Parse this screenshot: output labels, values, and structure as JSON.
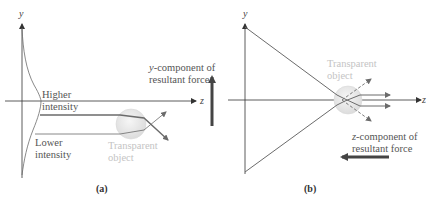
{
  "panel_a": {
    "caption": "(a)",
    "y_axis_label": "y",
    "z_axis_label": "z",
    "higher_intensity_line1": "Higher",
    "higher_intensity_line2": "intensity",
    "lower_intensity_line1": "Lower",
    "lower_intensity_line2": "intensity",
    "object_line1": "Transparent",
    "object_line2": "object",
    "force_var": "y",
    "force_line1_rest": "-component of",
    "force_line2": "resultant force"
  },
  "panel_b": {
    "caption": "(b)",
    "y_axis_label": "y",
    "z_axis_label": "z",
    "object_line1": "Transparent",
    "object_line2": "object",
    "force_var": "z",
    "force_line1_rest": "-component of",
    "force_line2": "resultant force"
  },
  "colors": {
    "ray": "#6b6b6b",
    "axis": "#333333",
    "force_arrow": "#444444",
    "sphere_fill": "#e6e6e6",
    "faint_text": "#c4c4c4"
  }
}
